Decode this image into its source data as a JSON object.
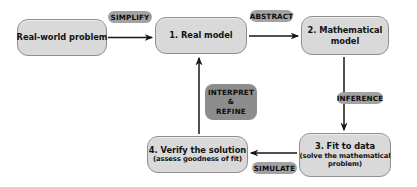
{
  "diagram": {
    "type": "flowchart",
    "colors": {
      "node_fill": "#d9d9d9",
      "node_border": "#8e8e8e",
      "badge_fill": "#a2a2a2",
      "badge_fill_dark": "#8d8d8d",
      "arrow": "#1a1a1a",
      "background": "#ffffff"
    },
    "nodes": [
      {
        "id": "real-world-problem",
        "lines": [
          "Real-world problem"
        ],
        "sublines": []
      },
      {
        "id": "real-model",
        "lines": [
          "1. Real model"
        ],
        "sublines": []
      },
      {
        "id": "mathematical-model",
        "lines": [
          "2. Mathematical",
          "model"
        ],
        "sublines": []
      },
      {
        "id": "fit-to-data",
        "lines": [
          "3. Fit to data"
        ],
        "sublines": [
          "(solve the mathematical",
          "problem)"
        ]
      },
      {
        "id": "verify-the-solution",
        "lines": [
          "4. Verify the solution"
        ],
        "sublines": [
          "(assess goodness of fit)"
        ]
      }
    ],
    "edge_labels": [
      {
        "id": "simplify",
        "text": "SIMPLIFY"
      },
      {
        "id": "abstract",
        "text": "ABSTRACT"
      },
      {
        "id": "inference",
        "text": "INFERENCE"
      },
      {
        "id": "simulate",
        "text": "SIMULATE"
      },
      {
        "id": "interpret-refine",
        "line1": "INTERPRET",
        "line2": "&",
        "line3": "REFINE"
      }
    ],
    "edges": [
      {
        "from": "real-world-problem",
        "to": "real-model",
        "label": "SIMPLIFY",
        "direction": "right"
      },
      {
        "from": "real-model",
        "to": "mathematical-model",
        "label": "ABSTRACT",
        "direction": "right"
      },
      {
        "from": "mathematical-model",
        "to": "fit-to-data",
        "label": "INFERENCE",
        "direction": "down"
      },
      {
        "from": "fit-to-data",
        "to": "verify-the-solution",
        "label": "SIMULATE",
        "direction": "left"
      },
      {
        "from": "verify-the-solution",
        "to": "real-model",
        "label": "INTERPRET & REFINE",
        "direction": "up"
      }
    ]
  }
}
